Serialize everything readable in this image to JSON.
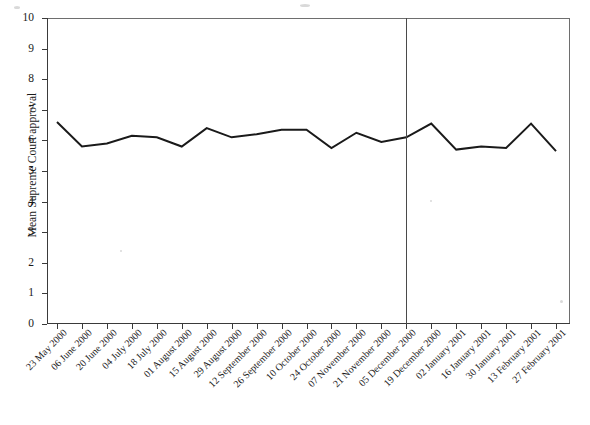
{
  "chart_data": {
    "type": "line",
    "title": "",
    "xlabel": "",
    "ylabel": "Mean Supreme Court approval",
    "ylim": [
      0,
      10
    ],
    "ytick_labels": [
      "0",
      "1",
      "2",
      "3",
      "4",
      "5",
      "6",
      "7",
      "8",
      "9",
      "10"
    ],
    "ytick_values": [
      0,
      1,
      2,
      3,
      4,
      5,
      6,
      7,
      8,
      9,
      10
    ],
    "grid": false,
    "legend": "none",
    "categories": [
      "23 May 2000",
      "06 June 2000",
      "20 June 2000",
      "04 July 2000",
      "18 July 2000",
      "01 August 2000",
      "15 August 2000",
      "29 August 2000",
      "12 September 2000",
      "26 September 2000",
      "10 October 2000",
      "24 October 2000",
      "07 November 2000",
      "21 November 2000",
      "05 December 2000",
      "19 December 2000",
      "02 January 2001",
      "16 January 2001",
      "30 January 2001",
      "13 February 2001",
      "27 February 2001"
    ],
    "series": [
      {
        "name": "Mean Supreme Court approval",
        "values": [
          6.6,
          5.8,
          5.9,
          6.15,
          6.1,
          5.8,
          6.4,
          6.1,
          6.2,
          6.35,
          6.35,
          5.75,
          6.25,
          5.95,
          6.1,
          6.55,
          5.7,
          5.8,
          5.75,
          6.55,
          5.65
        ]
      }
    ],
    "annotations": [
      {
        "type": "vertical-reference-line",
        "at_category": "05 December 2000",
        "label": ""
      }
    ],
    "colors": {
      "line": "#1a1a1a",
      "axis": "#3a3a3a",
      "reference_line": "#4a4a4a",
      "background": "#ffffff"
    }
  }
}
